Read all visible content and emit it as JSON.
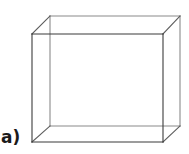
{
  "figure": {
    "label": "a)",
    "caption_letter": "a",
    "kind": "wireframe-cuboid",
    "background_color": "#ffffff",
    "canvas": {
      "width": 189,
      "height": 154
    }
  },
  "styles": {
    "front_edge_color": "#3b3b3b",
    "back_edge_color": "#8a8a8a",
    "connector_edge_color": "#5c5c5c",
    "stroke_width": 1.1
  },
  "chart_data": {
    "type": "diagram",
    "title": "a)",
    "geometry": "cuboid-wireframe-oblique-projection",
    "projection_offset": {
      "dx": 18,
      "dy": -18
    },
    "vertices": {
      "front_top_left": [
        32,
        34
      ],
      "front_top_right": [
        163,
        34
      ],
      "front_bottom_right": [
        163,
        142
      ],
      "front_bottom_left": [
        32,
        142
      ],
      "back_top_left": [
        50,
        16
      ],
      "back_top_right": [
        180,
        16
      ],
      "back_bottom_right": [
        180,
        126
      ],
      "back_bottom_left": [
        50,
        126
      ]
    },
    "edges": [
      {
        "name": "front-top",
        "from": "front_top_left",
        "to": "front_top_right",
        "group": "front"
      },
      {
        "name": "front-right",
        "from": "front_top_right",
        "to": "front_bottom_right",
        "group": "front"
      },
      {
        "name": "front-bottom",
        "from": "front_bottom_right",
        "to": "front_bottom_left",
        "group": "front"
      },
      {
        "name": "front-left",
        "from": "front_bottom_left",
        "to": "front_top_left",
        "group": "front"
      },
      {
        "name": "back-top",
        "from": "back_top_left",
        "to": "back_top_right",
        "group": "back"
      },
      {
        "name": "back-right",
        "from": "back_top_right",
        "to": "back_bottom_right",
        "group": "back"
      },
      {
        "name": "back-bottom",
        "from": "back_bottom_right",
        "to": "back_bottom_left",
        "group": "back"
      },
      {
        "name": "back-left",
        "from": "back_bottom_left",
        "to": "back_top_left",
        "group": "back"
      },
      {
        "name": "connector-top-left",
        "from": "front_top_left",
        "to": "back_top_left",
        "group": "connector"
      },
      {
        "name": "connector-top-right",
        "from": "front_top_right",
        "to": "back_top_right",
        "group": "connector"
      },
      {
        "name": "connector-bottom-right",
        "from": "front_bottom_right",
        "to": "back_bottom_right",
        "group": "connector"
      },
      {
        "name": "connector-bottom-left",
        "from": "front_bottom_left",
        "to": "back_bottom_left",
        "group": "connector"
      }
    ]
  }
}
